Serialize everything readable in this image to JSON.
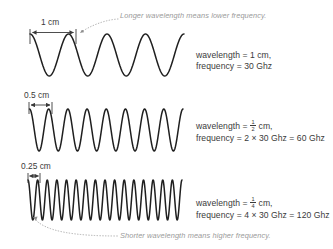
{
  "figure": {
    "title_alt": "Wavelength and frequency comparison",
    "background": "#ffffff",
    "wave_color": "#1f1f1f",
    "dim_color": "#3a3a3a",
    "callout_color": "#9a9a9a"
  },
  "callouts": {
    "top": "Longer wavelength means lower frequency.",
    "bottom": "Shorter wavelength means higher frequency."
  },
  "rows": [
    {
      "id": "row-1-cm",
      "dimension_label": "1 cm",
      "wavelength_line_prefix": "wavelength = ",
      "wavelength_value": "1",
      "wavelength_unit": " cm,",
      "wavelength_is_fraction": "false",
      "fraction_numerator": "",
      "fraction_denominator": "",
      "frequency_line": "frequency = 30 Ghz",
      "cycles": 4,
      "wavelength_cm": 1,
      "frequency_ghz": 30
    },
    {
      "id": "row-half-cm",
      "dimension_label": "0.5 cm",
      "wavelength_line_prefix": "wavelength = ",
      "wavelength_value": "1/2",
      "wavelength_unit": " cm,",
      "wavelength_is_fraction": "true",
      "fraction_numerator": "1",
      "fraction_denominator": "2",
      "frequency_line": "frequency = 2 × 30 Ghz = 60 Ghz",
      "cycles": 8,
      "wavelength_cm": 0.5,
      "frequency_ghz": 60
    },
    {
      "id": "row-quarter-cm",
      "dimension_label": "0.25 cm",
      "wavelength_line_prefix": "wavelength = ",
      "wavelength_value": "1/4",
      "wavelength_unit": " cm,",
      "wavelength_is_fraction": "true",
      "fraction_numerator": "1",
      "fraction_denominator": "4",
      "frequency_line": "frequency = 4 × 30 Ghz = 120 Ghz",
      "cycles": 16,
      "wavelength_cm": 0.25,
      "frequency_ghz": 120
    }
  ],
  "chart_data": {
    "type": "line",
    "xlabel": "",
    "ylabel": "",
    "series": [
      {
        "name": "1 cm wavelength, 30 Ghz",
        "cycles": 4,
        "wavelength_cm": 1,
        "frequency_ghz": 30
      },
      {
        "name": "0.5 cm wavelength, 60 Ghz",
        "cycles": 8,
        "wavelength_cm": 0.5,
        "frequency_ghz": 60
      },
      {
        "name": "0.25 cm wavelength, 120 Ghz",
        "cycles": 16,
        "wavelength_cm": 0.25,
        "frequency_ghz": 120
      }
    ],
    "annotations": [
      "Longer wavelength means lower frequency.",
      "Shorter wavelength means higher frequency."
    ]
  }
}
